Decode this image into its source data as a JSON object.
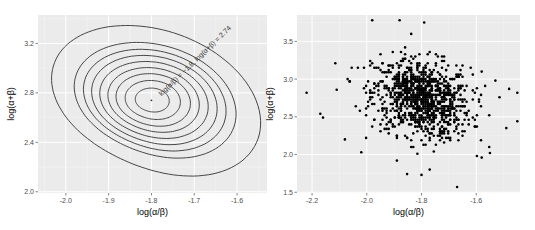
{
  "chart_data": [
    {
      "type": "contour",
      "title": "",
      "xlabel": "log(α/β)",
      "ylabel": "log(α+β)",
      "xlim": [
        -2.065,
        -1.53
      ],
      "ylim": [
        1.99,
        3.43
      ],
      "xticks": [
        -2.0,
        -1.9,
        -1.8,
        -1.7,
        -1.6
      ],
      "xtick_labels": [
        "-2.0",
        "-1.9",
        "-1.8",
        "-1.7",
        "-1.6"
      ],
      "yticks": [
        2.0,
        2.4,
        2.8,
        3.2
      ],
      "ytick_labels": [
        "2.0",
        "2.4",
        "2.8",
        "3.2"
      ],
      "grid": true,
      "mode": {
        "x": -1.8,
        "y": 2.74
      },
      "annotation": "log(α/β) = −1.8, log(α+β) = 2.74",
      "contour_levels": 9,
      "background": "#ebebeb",
      "line_color": "#333333"
    },
    {
      "type": "scatter",
      "title": "",
      "xlabel": "log(α/β)",
      "ylabel": "log(α+β)",
      "xlim": [
        -2.255,
        -1.44
      ],
      "ylim": [
        1.49,
        3.85
      ],
      "xticks": [
        -2.2,
        -2.0,
        -1.8,
        -1.6
      ],
      "xtick_labels": [
        "-2.2",
        "-2.0",
        "-1.8",
        "-1.6"
      ],
      "yticks": [
        1.5,
        2.0,
        2.5,
        3.0,
        3.5
      ],
      "ytick_labels": [
        "1.5",
        "2.0",
        "2.5",
        "3.0",
        "3.5"
      ],
      "grid": true,
      "n_points": 1000,
      "center": {
        "x": -1.8,
        "y": 2.74
      },
      "sd": {
        "x": 0.09,
        "y": 0.34
      },
      "outliers": [
        {
          "x": -2.22,
          "y": 2.82
        },
        {
          "x": -2.17,
          "y": 2.54
        },
        {
          "x": -2.16,
          "y": 2.49
        },
        {
          "x": -2.11,
          "y": 2.86
        },
        {
          "x": -2.08,
          "y": 2.2
        },
        {
          "x": -2.02,
          "y": 2.03
        },
        {
          "x": -1.98,
          "y": 3.78
        },
        {
          "x": -1.88,
          "y": 3.78
        },
        {
          "x": -1.8,
          "y": 1.73
        },
        {
          "x": -1.77,
          "y": 1.8
        },
        {
          "x": -1.67,
          "y": 1.57
        },
        {
          "x": -1.79,
          "y": 3.75
        },
        {
          "x": -1.58,
          "y": 3.1
        },
        {
          "x": -1.53,
          "y": 2.98
        },
        {
          "x": -1.48,
          "y": 2.87
        },
        {
          "x": -1.45,
          "y": 2.82
        },
        {
          "x": -1.45,
          "y": 2.44
        },
        {
          "x": -1.49,
          "y": 2.35
        },
        {
          "x": -1.55,
          "y": 2.02
        },
        {
          "x": -1.58,
          "y": 1.96
        }
      ],
      "background": "#ebebeb",
      "point_color": "#000000"
    }
  ],
  "panels": {
    "left": {
      "x_axis_title": "log(α/β)",
      "y_axis_title": "log(α+β)",
      "annotation": "log(α/β) = −1.8, log(α+β) = 2.74"
    },
    "right": {
      "x_axis_title": "log(α/β)",
      "y_axis_title": "log(α+β)"
    }
  }
}
